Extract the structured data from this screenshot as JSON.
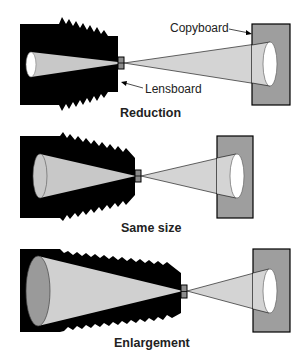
{
  "diagram": {
    "colors": {
      "camera": "#000000",
      "cone_inside": "#c8c8c8",
      "cone_outside": "#d4d4d4",
      "ground_glass": "#9a9a9a",
      "copyboard": "#9e9e9e",
      "copy_image": "#ffffff",
      "lensboard": "#8c8c8c",
      "text": "#222222"
    },
    "labels": {
      "copyboard": "Copyboard",
      "lensboard": "Lensboard"
    },
    "panels": [
      {
        "caption": "Reduction"
      },
      {
        "caption": "Same size"
      },
      {
        "caption": "Enlargement"
      }
    ]
  }
}
